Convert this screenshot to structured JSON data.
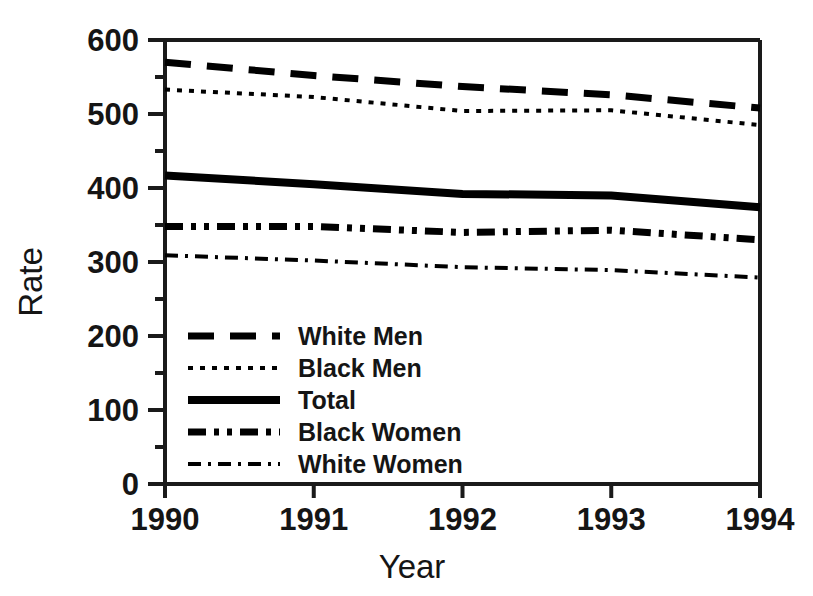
{
  "chart_data": {
    "type": "line",
    "title": "",
    "xlabel": "Year",
    "ylabel": "Rate",
    "categories": [
      "1990",
      "1991",
      "1992",
      "1993",
      "1994"
    ],
    "x": [
      1990,
      1991,
      1992,
      1993,
      1994
    ],
    "xlim": [
      1990,
      1994
    ],
    "ylim": [
      0,
      600
    ],
    "grid": false,
    "legend_position": "inside-lower-left",
    "y_ticks_major": [
      0,
      100,
      200,
      300,
      400,
      500,
      600
    ],
    "y_ticks_minor": [
      50,
      150,
      250,
      350,
      450,
      550
    ],
    "y_tick_labels": [
      "0",
      "100",
      "200",
      "300",
      "400",
      "500",
      "600"
    ],
    "x_tick_labels": [
      "1990",
      "1991",
      "1992",
      "1993",
      "1994"
    ],
    "series": [
      {
        "name": "White Men",
        "style": "long-dash",
        "stroke_width": 7,
        "dash_array": "26 16",
        "values": [
          570,
          552,
          537,
          526,
          508
        ]
      },
      {
        "name": "Black Men",
        "style": "dotted",
        "stroke_width": 4,
        "dash_array": "5 7",
        "values": [
          533,
          523,
          504,
          505,
          485
        ]
      },
      {
        "name": "Total",
        "style": "solid",
        "stroke_width": 8,
        "dash_array": "none",
        "values": [
          417,
          405,
          392,
          390,
          374
        ]
      },
      {
        "name": "Black Women",
        "style": "dash-dot-dot",
        "stroke_width": 7,
        "dash_array": "18 8 5 8 5 8",
        "values": [
          348,
          348,
          340,
          343,
          330
        ]
      },
      {
        "name": "White Women",
        "style": "dash-dot",
        "stroke_width": 4,
        "dash_array": "13 7 3 7",
        "values": [
          309,
          302,
          293,
          289,
          279
        ]
      }
    ]
  },
  "legend": {
    "items": [
      {
        "label": "White Men"
      },
      {
        "label": "Black Men"
      },
      {
        "label": "Total"
      },
      {
        "label": "Black Women"
      },
      {
        "label": "White Women"
      }
    ]
  },
  "axes": {
    "y_title": "Rate",
    "x_title": "Year"
  },
  "colors": {
    "ink": "#000000",
    "background": "#ffffff"
  }
}
